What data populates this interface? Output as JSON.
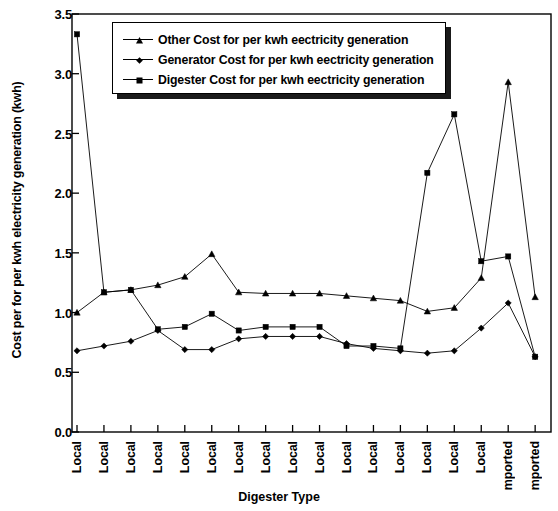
{
  "chart_data": {
    "type": "line",
    "title": "",
    "xlabel": "Digester Type",
    "ylabel": "Cost per for per kwh electricity generation (kwh)",
    "ylim": [
      0.0,
      3.5
    ],
    "yticks": [
      "0.0",
      "0.5",
      "1.0",
      "1.5",
      "2.0",
      "2.5",
      "3.0",
      "3.5"
    ],
    "ytick_values": [
      0.0,
      0.5,
      1.0,
      1.5,
      2.0,
      2.5,
      3.0,
      3.5
    ],
    "grid": false,
    "legend_position": "top-center",
    "categories": [
      "Local",
      "Local",
      "Local",
      "Local",
      "Local",
      "Local",
      "Local",
      "Local",
      "Local",
      "Local",
      "Local",
      "Local",
      "Local",
      "Local",
      "Local",
      "Local",
      "mported",
      "mported"
    ],
    "series": [
      {
        "name": "Other Cost for per kwh eectricity generation",
        "marker": "triangle",
        "values": [
          1.0,
          1.17,
          1.19,
          1.23,
          1.3,
          1.49,
          1.17,
          1.16,
          1.16,
          1.16,
          1.14,
          1.12,
          1.1,
          1.01,
          1.04,
          1.29,
          2.93,
          1.13
        ]
      },
      {
        "name": "Generator Cost  for per kwh eectricity generation",
        "marker": "diamond",
        "values": [
          0.68,
          0.72,
          0.76,
          0.85,
          0.69,
          0.69,
          0.78,
          0.8,
          0.8,
          0.8,
          0.74,
          0.7,
          0.68,
          0.66,
          0.68,
          0.87,
          1.08,
          0.63
        ]
      },
      {
        "name": "Digester Cost for per kwh eectricity generation",
        "marker": "square",
        "values": [
          3.33,
          1.17,
          1.19,
          0.86,
          0.88,
          0.99,
          0.85,
          0.88,
          0.88,
          0.88,
          0.72,
          0.72,
          0.7,
          2.17,
          2.66,
          1.43,
          1.47,
          0.63
        ]
      }
    ]
  },
  "legend": {
    "items": [
      "Other Cost for per kwh eectricity generation",
      "Generator Cost  for per kwh eectricity generation",
      "Digester Cost for per kwh eectricity generation"
    ]
  },
  "axes": {
    "y_title": "Cost per for per kwh electricity generation (kwh)",
    "x_title": "Digester Type"
  }
}
